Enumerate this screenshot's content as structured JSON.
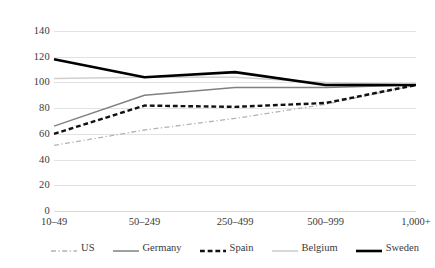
{
  "chart_data": {
    "type": "line",
    "title": "",
    "subtitle": "",
    "xlabel": "",
    "ylabel": "",
    "categories": [
      "10–49",
      "50–249",
      "250–499",
      "500–999",
      "1,000+"
    ],
    "ylim": [
      0,
      140
    ],
    "ytick_values": [
      0,
      20,
      40,
      60,
      80,
      100,
      120,
      140
    ],
    "ytick_labels": [
      "0",
      "20",
      "40",
      "60",
      "80",
      "100",
      "120",
      "140"
    ],
    "grid": "horizontal",
    "legend_position": "bottom",
    "series": [
      {
        "name": "US",
        "values": [
          51,
          63,
          72,
          83,
          98
        ],
        "color": "#b3b3b3",
        "style": "dashdot",
        "width": 1.3
      },
      {
        "name": "Germany",
        "values": [
          66,
          90,
          96,
          96,
          98
        ],
        "color": "#808080",
        "style": "solid",
        "width": 1.5
      },
      {
        "name": "Spain",
        "values": [
          60,
          82,
          81,
          84,
          98
        ],
        "color": "#111111",
        "style": "dashed",
        "width": 2.4
      },
      {
        "name": "Belgium",
        "values": [
          103,
          104,
          104,
          100,
          98
        ],
        "color": "#cfcfcf",
        "style": "solid",
        "width": 1.6
      },
      {
        "name": "Sweden",
        "values": [
          118,
          104,
          108,
          98,
          98
        ],
        "color": "#000000",
        "style": "solid",
        "width": 2.6
      }
    ]
  },
  "legend": {
    "items": [
      {
        "label": "US"
      },
      {
        "label": "Germany"
      },
      {
        "label": "Spain"
      },
      {
        "label": "Belgium"
      },
      {
        "label": "Sweden"
      }
    ]
  },
  "artifacts": {
    "top_left_smudge": "",
    "top_center_smudge": ""
  }
}
